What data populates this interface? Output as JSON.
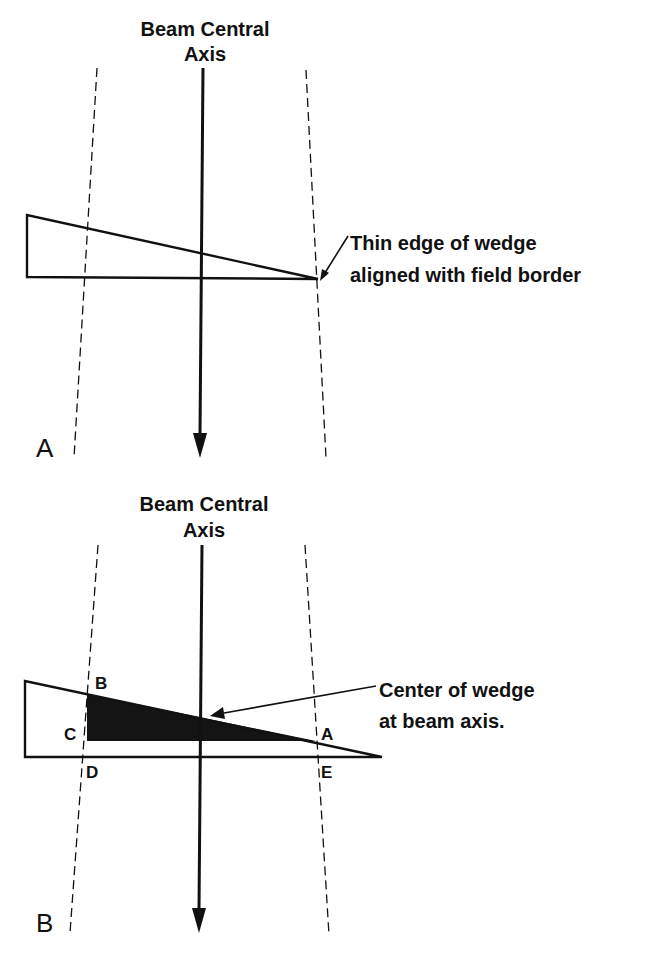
{
  "colors": {
    "background": "#ffffff",
    "ink": "#111111",
    "shade": "#141414"
  },
  "panels": [
    {
      "id": "A",
      "panel_label": "A",
      "title_line1": "Beam Central",
      "title_line2": "Axis",
      "annotation_line1": "Thin edge of wedge",
      "annotation_line2": "aligned with field border",
      "icons": [
        "beam-axis-arrow-icon",
        "annotation-arrow-icon"
      ]
    },
    {
      "id": "B",
      "panel_label": "B",
      "title_line1": "Beam Central",
      "title_line2": "Axis",
      "annotation_line1": "Center of wedge",
      "annotation_line2": "at beam axis.",
      "point_labels": {
        "A": "A",
        "B": "B",
        "C": "C",
        "D": "D",
        "E": "E"
      },
      "icons": [
        "beam-axis-arrow-icon",
        "annotation-arrow-icon"
      ]
    }
  ]
}
